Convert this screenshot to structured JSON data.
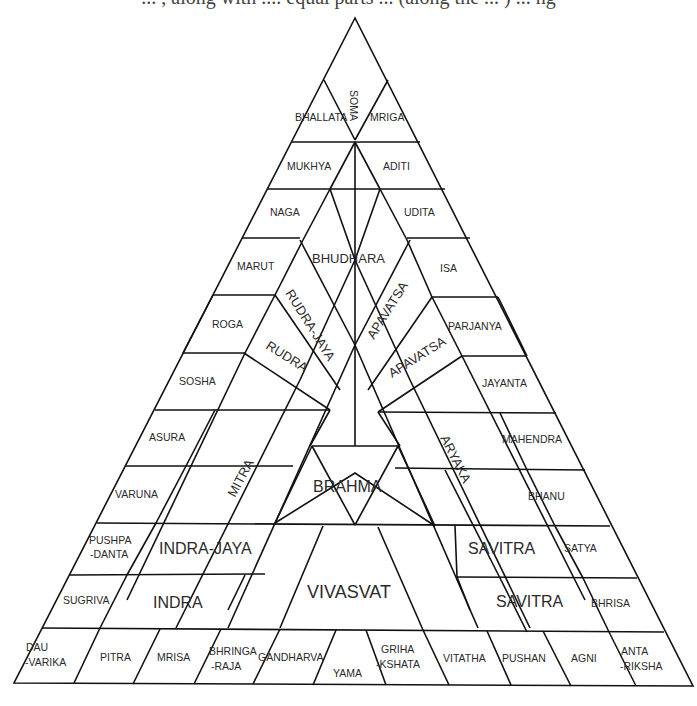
{
  "caption_fragment": "... , along with .... equal parts ... (along the ... ) ... ng",
  "diagram": {
    "apex": {
      "label": "SOMA"
    },
    "left_outer": [
      "BHALLATA",
      "MUKHYA",
      "NAGA",
      "MARUT",
      "ROGA",
      "SOSHA",
      "ASURA",
      "VARUNA",
      "PUSHPA\n-DANTA",
      "SUGRIVA"
    ],
    "right_outer": [
      "MRIGA",
      "ADITI",
      "UDITA",
      "ISA",
      "PARJANYA",
      "JAYANTA",
      "MAHENDRA",
      "BHANU",
      "SATYA",
      "BHRISA"
    ],
    "bottom_row": [
      "DAU\n-VARIKA",
      "PITRA",
      "MRISA",
      "BHRINGA\n-RAJA",
      "GANDHARVA",
      "YAMA",
      "GRIHA\n-KSHATA",
      "VITATHA",
      "PUSHAN",
      "AGNI",
      "ANTA\n-RIKSHA"
    ],
    "inner": {
      "bhudhara": "BHUDHARA",
      "rudra_jaya": "RUDRA-JAYA",
      "rudra": "RUDRA",
      "apavatsa_1": "APAVATSA",
      "apavatsa_2": "APAVATSA",
      "mitra": "MITRA",
      "aryaka": "ARYAKA",
      "brahma": "BRAHMA",
      "indra_jaya": "INDRA-JAYA",
      "indra": "INDRA",
      "vivasvat": "VIVASVAT",
      "savitra_1": "SAVITRA",
      "savitra_2": "SAVITRA"
    }
  }
}
